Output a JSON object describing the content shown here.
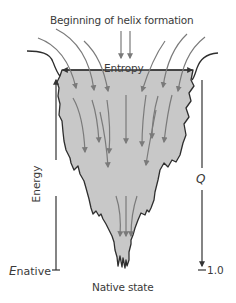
{
  "diagram": {
    "title": "Beginning of helix formation",
    "top_axis_label": "Entropy",
    "left_axis_label": "Energy",
    "left_axis_bottom_label_symbol": "E",
    "left_axis_bottom_label_subscript": "native",
    "right_axis_label": "Q",
    "right_axis_bottom_value": "1.0",
    "bottom_label": "Native state",
    "colors": {
      "funnel_fill": "#c8c8c8",
      "funnel_outline": "#2e2e2e",
      "arrow_gray": "#7a7a7a",
      "axis_line": "#333333",
      "text": "#3a3a3a"
    }
  }
}
